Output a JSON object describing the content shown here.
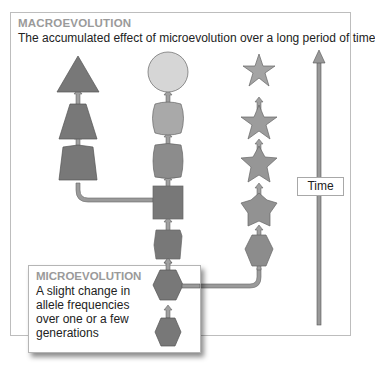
{
  "macro": {
    "title": "MACROEVOLUTION",
    "description": "The accumulated effect of microevolution over a long period of time"
  },
  "micro": {
    "title": "MICROEVOLUTION",
    "description": "A slight change in allele frequencies over one or a few generations"
  },
  "time_axis": {
    "label": "Time",
    "direction": "up"
  },
  "lineages": [
    {
      "name": "left",
      "shapes": [
        "trapezoid-narrow",
        "trapezoid",
        "triangle"
      ]
    },
    {
      "name": "middle",
      "shapes": [
        "hexagon",
        "hexagon",
        "octagon",
        "square",
        "rounded-square",
        "rounded-square",
        "circle"
      ]
    },
    {
      "name": "right",
      "shapes": [
        "hexagon",
        "pentagon-star",
        "star",
        "star",
        "star"
      ]
    }
  ],
  "colors": {
    "dark_fill": "#787878",
    "mid_fill": "#8c8c8c",
    "light_fill": "#a9a9a9",
    "lightest_fill": "#d6d6d6",
    "arrow": "#8e8e8e",
    "title_gray": "#9a9a9a"
  }
}
